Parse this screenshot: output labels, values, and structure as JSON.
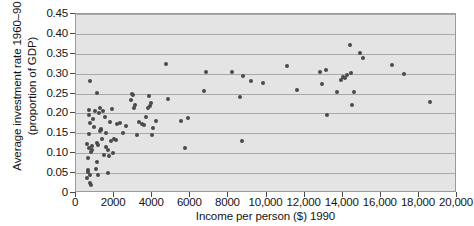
{
  "chart_data": {
    "type": "scatter",
    "title": "",
    "xlabel": "Income per person ($) 1990",
    "ylabel": "Average investment rate 1960–90 (proportion of GDP)",
    "ylabel_line1": "Average investment rate 1960–90",
    "ylabel_line2": "(proportion of GDP)",
    "xlim": [
      0,
      20000
    ],
    "ylim": [
      0,
      0.45
    ],
    "grid": "horizontal",
    "legend": "none",
    "marker_color": "#4a4a4a",
    "plot_background": "#e4e4e4",
    "gridline_color": "#a9a9a9",
    "axis_color": "#4a4a4a",
    "xticks": [
      0,
      2000,
      4000,
      6000,
      8000,
      10000,
      12000,
      14000,
      16000,
      18000,
      20000
    ],
    "xtick_labels": [
      "0",
      "2000",
      "4000",
      "6000",
      "8000",
      "10,000",
      "12,000",
      "14,000",
      "16,000",
      "18,000",
      "20,000"
    ],
    "yticks": [
      0,
      0.05,
      0.1,
      0.15,
      0.2,
      0.25,
      0.3,
      0.35,
      0.4,
      0.45
    ],
    "ytick_labels": [
      "0",
      "0.05",
      "0.10",
      "0.15",
      "0.20",
      "0.25",
      "0.30",
      "0.35",
      "0.40",
      "0.45"
    ],
    "points": [
      [
        560,
        0.038
      ],
      [
        600,
        0.122
      ],
      [
        610,
        0.089
      ],
      [
        620,
        0.052
      ],
      [
        640,
        0.057
      ],
      [
        660,
        0.195
      ],
      [
        670,
        0.148
      ],
      [
        690,
        0.208
      ],
      [
        700,
        0.112
      ],
      [
        710,
        0.046
      ],
      [
        720,
        0.026
      ],
      [
        750,
        0.176
      ],
      [
        760,
        0.281
      ],
      [
        780,
        0.019
      ],
      [
        800,
        0.102
      ],
      [
        820,
        0.118
      ],
      [
        860,
        0.108
      ],
      [
        900,
        0.186
      ],
      [
        960,
        0.166
      ],
      [
        1000,
        0.206
      ],
      [
        1040,
        0.06
      ],
      [
        1080,
        0.078
      ],
      [
        1100,
        0.252
      ],
      [
        1120,
        0.126
      ],
      [
        1150,
        0.046
      ],
      [
        1180,
        0.12
      ],
      [
        1200,
        0.201
      ],
      [
        1250,
        0.155
      ],
      [
        1280,
        0.213
      ],
      [
        1300,
        0.162
      ],
      [
        1320,
        0.158
      ],
      [
        1360,
        0.135
      ],
      [
        1400,
        0.205
      ],
      [
        1450,
        0.096
      ],
      [
        1500,
        0.19
      ],
      [
        1560,
        0.116
      ],
      [
        1600,
        0.151
      ],
      [
        1660,
        0.05
      ],
      [
        1700,
        0.108
      ],
      [
        1750,
        0.094
      ],
      [
        1800,
        0.179
      ],
      [
        1860,
        0.13
      ],
      [
        1900,
        0.211
      ],
      [
        1960,
        0.101
      ],
      [
        2020,
        0.135
      ],
      [
        2080,
        0.132
      ],
      [
        2150,
        0.174
      ],
      [
        2300,
        0.177
      ],
      [
        2450,
        0.152
      ],
      [
        2600,
        0.168
      ],
      [
        2900,
        0.234
      ],
      [
        2960,
        0.25
      ],
      [
        3000,
        0.246
      ],
      [
        3050,
        0.213
      ],
      [
        3100,
        0.22
      ],
      [
        3200,
        0.147
      ],
      [
        3300,
        0.178
      ],
      [
        3450,
        0.173
      ],
      [
        3550,
        0.17
      ],
      [
        3700,
        0.191
      ],
      [
        3780,
        0.213
      ],
      [
        3850,
        0.245
      ],
      [
        3900,
        0.218
      ],
      [
        3950,
        0.226
      ],
      [
        4000,
        0.146
      ],
      [
        4050,
        0.163
      ],
      [
        4200,
        0.181
      ],
      [
        4750,
        0.324
      ],
      [
        4850,
        0.237
      ],
      [
        5500,
        0.181
      ],
      [
        5700,
        0.112
      ],
      [
        5900,
        0.188
      ],
      [
        6700,
        0.257
      ],
      [
        6800,
        0.305
      ],
      [
        8200,
        0.305
      ],
      [
        8600,
        0.241
      ],
      [
        8700,
        0.131
      ],
      [
        8750,
        0.294
      ],
      [
        9200,
        0.282
      ],
      [
        9800,
        0.276
      ],
      [
        11100,
        0.319
      ],
      [
        11600,
        0.26
      ],
      [
        12800,
        0.305
      ],
      [
        12900,
        0.273
      ],
      [
        13100,
        0.31
      ],
      [
        13200,
        0.197
      ],
      [
        13700,
        0.253
      ],
      [
        13900,
        0.285
      ],
      [
        14000,
        0.291
      ],
      [
        14100,
        0.288
      ],
      [
        14250,
        0.296
      ],
      [
        14400,
        0.373
      ],
      [
        14450,
        0.301
      ],
      [
        14500,
        0.221
      ],
      [
        14600,
        0.253
      ],
      [
        14900,
        0.353
      ],
      [
        15050,
        0.339
      ],
      [
        16600,
        0.321
      ],
      [
        17200,
        0.3
      ],
      [
        18600,
        0.228
      ]
    ]
  },
  "caption": {
    "sliver": ""
  }
}
